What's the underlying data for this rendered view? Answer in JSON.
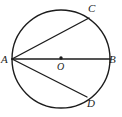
{
  "figure": {
    "kind": "circle-geometry-diagram",
    "background_color": "#ffffff",
    "stroke_color": "#1c1c1c",
    "label_color": "#1c1c1c",
    "circle": {
      "center_x": 61,
      "center_y": 59,
      "radius": 49
    },
    "center_dot": {
      "x": 61,
      "y": 58,
      "radius": 1.6
    },
    "points": [
      {
        "id": "A",
        "label": "A",
        "x": 12,
        "y": 59
      },
      {
        "id": "B",
        "label": "B",
        "x": 110,
        "y": 59
      },
      {
        "id": "C",
        "label": "C",
        "x": 89,
        "y": 18
      },
      {
        "id": "D",
        "label": "D",
        "x": 87,
        "y": 97
      },
      {
        "id": "O",
        "label": "O",
        "x": 61,
        "y": 58
      }
    ],
    "segments": [
      {
        "id": "AB",
        "from": "A",
        "to": "B",
        "x1": 12,
        "y1": 59,
        "x2": 110,
        "y2": 59
      },
      {
        "id": "AC",
        "from": "A",
        "to": "C",
        "x1": 12,
        "y1": 59,
        "x2": 89,
        "y2": 18
      },
      {
        "id": "AD",
        "from": "A",
        "to": "D",
        "x1": 12,
        "y1": 59,
        "x2": 87,
        "y2": 97
      }
    ],
    "labels": {
      "a": "A",
      "b": "B",
      "c": "C",
      "d": "D",
      "o": "O"
    }
  }
}
